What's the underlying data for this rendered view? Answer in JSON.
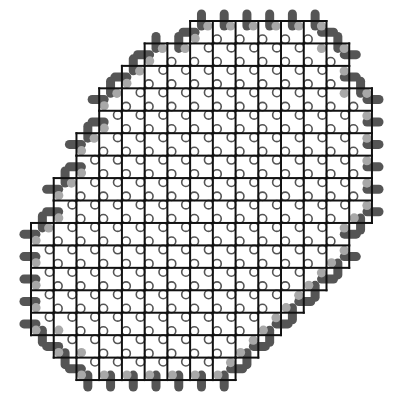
{
  "diagram": {
    "type": "lattice-patch",
    "width": 398,
    "height": 408,
    "grid": {
      "origin_x": 31,
      "origin_y": 21,
      "dx": 22.73,
      "dy": 22.44,
      "line_color": "#111111",
      "line_width": 2
    },
    "rows": [
      {
        "row": 0,
        "left": 7,
        "right": 13
      },
      {
        "row": 1,
        "left": 5,
        "right": 14
      },
      {
        "row": 2,
        "left": 4,
        "right": 14
      },
      {
        "row": 3,
        "left": 3,
        "right": 15
      },
      {
        "row": 4,
        "left": 3,
        "right": 15
      },
      {
        "row": 5,
        "left": 2,
        "right": 15
      },
      {
        "row": 6,
        "left": 2,
        "right": 15
      },
      {
        "row": 7,
        "left": 1,
        "right": 15
      },
      {
        "row": 8,
        "left": 1,
        "right": 15
      },
      {
        "row": 9,
        "left": 0,
        "right": 14
      },
      {
        "row": 10,
        "left": 0,
        "right": 14
      },
      {
        "row": 11,
        "left": 0,
        "right": 13
      },
      {
        "row": 12,
        "left": 0,
        "right": 12
      },
      {
        "row": 13,
        "left": 0,
        "right": 11
      },
      {
        "row": 14,
        "left": 1,
        "right": 10
      },
      {
        "row": 15,
        "left": 2,
        "right": 9
      }
    ],
    "markers": {
      "interior_qubit": {
        "shape": "open-circle",
        "radius": 4.2,
        "stroke": "#555555",
        "fill": "#ffffff",
        "offset": 4.2
      },
      "boundary_qubit": {
        "shape": "filled-dot",
        "radius": 4.6,
        "fill": "#a8a8a8",
        "offset": 5
      },
      "boundary_pill": {
        "shape": "pill",
        "length": 21,
        "thickness": 9,
        "fill": "#555555"
      }
    }
  }
}
